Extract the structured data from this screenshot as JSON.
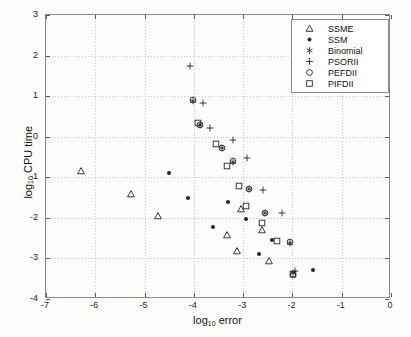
{
  "chart_data": {
    "type": "scatter",
    "title": "",
    "xlabel": "log10 error",
    "ylabel": "log10 CPU time",
    "xlim": [
      -7,
      0
    ],
    "ylim": [
      -4,
      3
    ],
    "xticks": [
      -7,
      -6,
      -5,
      -4,
      -3,
      -2,
      -1,
      0
    ],
    "yticks": [
      -4,
      -3,
      -2,
      -1,
      0,
      1,
      2,
      3
    ],
    "xtick_labels": [
      "-7",
      "-6",
      "-5",
      "-4",
      "-3",
      "-2",
      "-1",
      "0"
    ],
    "ytick_labels": [
      "-4",
      "-3",
      "-2",
      "-1",
      "0",
      "1",
      "2",
      "3"
    ],
    "grid": true,
    "legend_position": "top-right",
    "series": [
      {
        "name": "SSME",
        "marker": "triangle",
        "points": [
          [
            -6.28,
            -0.85
          ],
          [
            -5.28,
            -1.4
          ],
          [
            -4.72,
            -1.95
          ],
          [
            -3.32,
            -2.42
          ],
          [
            -3.12,
            -2.82
          ],
          [
            -3.05,
            -1.78
          ],
          [
            -2.62,
            -2.3
          ],
          [
            -2.48,
            -3.07
          ]
        ]
      },
      {
        "name": "SSM",
        "marker": "dot",
        "points": [
          [
            -4.5,
            -0.9
          ],
          [
            -4.12,
            -1.52
          ],
          [
            -3.62,
            -2.22
          ],
          [
            -3.3,
            -1.62
          ],
          [
            -2.95,
            -2.02
          ],
          [
            -2.68,
            -2.9
          ],
          [
            -2.42,
            -2.55
          ],
          [
            -1.58,
            -3.28
          ]
        ]
      },
      {
        "name": "Binomial",
        "marker": "star",
        "points": [
          [
            -4.02,
            0.88
          ],
          [
            -3.88,
            0.28
          ],
          [
            -3.42,
            -0.28
          ],
          [
            -3.2,
            -0.62
          ],
          [
            -2.88,
            -1.28
          ],
          [
            -2.55,
            -1.88
          ],
          [
            -2.05,
            -2.62
          ],
          [
            -1.98,
            -3.35
          ]
        ]
      },
      {
        "name": "PSORII",
        "marker": "plus",
        "points": [
          [
            -4.08,
            1.75
          ],
          [
            -3.82,
            0.82
          ],
          [
            -3.68,
            0.22
          ],
          [
            -3.2,
            -0.08
          ],
          [
            -2.92,
            -0.52
          ],
          [
            -2.6,
            -1.32
          ],
          [
            -2.22,
            -1.88
          ],
          [
            -1.95,
            -3.32
          ]
        ]
      },
      {
        "name": "PEFDII",
        "marker": "circle",
        "points": [
          [
            -4.02,
            0.9
          ],
          [
            -3.88,
            0.3
          ],
          [
            -3.42,
            -0.28
          ],
          [
            -3.2,
            -0.6
          ],
          [
            -2.88,
            -1.28
          ],
          [
            -2.55,
            -1.88
          ],
          [
            -2.05,
            -2.6
          ],
          [
            -1.98,
            -3.42
          ]
        ]
      },
      {
        "name": "PIFDII",
        "marker": "square",
        "points": [
          [
            -3.92,
            0.35
          ],
          [
            -3.55,
            -0.18
          ],
          [
            -3.32,
            -0.72
          ],
          [
            -3.08,
            -1.22
          ],
          [
            -2.95,
            -1.7
          ],
          [
            -2.62,
            -2.12
          ],
          [
            -2.32,
            -2.58
          ],
          [
            -1.98,
            -3.38
          ]
        ]
      }
    ]
  },
  "legend": {
    "entries": [
      {
        "label": "SSME",
        "marker": "triangle"
      },
      {
        "label": "SSM",
        "marker": "dot"
      },
      {
        "label": "Binomial",
        "marker": "star"
      },
      {
        "label": "PSORII",
        "marker": "plus"
      },
      {
        "label": "PEFDII",
        "marker": "circle"
      },
      {
        "label": "PIFDII",
        "marker": "square"
      }
    ]
  },
  "axis_text": {
    "x_base": "log",
    "x_sub": "10",
    "x_rest": " error",
    "y_base": "log",
    "y_sub": "10",
    "y_rest": " CPU time"
  }
}
